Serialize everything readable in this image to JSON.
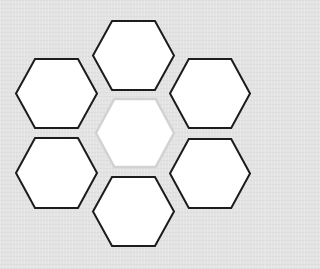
{
  "diagram": {
    "type": "hexagon-cluster",
    "background_color": "#e3e3e3",
    "hex_fill": "#ffffff",
    "outer_stroke_color": "#1c1c1c",
    "center_stroke_color": "#d2d2d2",
    "hexagons": [
      {
        "id": "top",
        "role": "outer",
        "label": "",
        "cx": 133.5,
        "cy": 55.5,
        "w": 81,
        "h": 69
      },
      {
        "id": "upper-left",
        "role": "outer",
        "label": "",
        "cx": 56.5,
        "cy": 93.5,
        "w": 81,
        "h": 69
      },
      {
        "id": "upper-right",
        "role": "outer",
        "label": "",
        "cx": 210,
        "cy": 93.5,
        "w": 80,
        "h": 69
      },
      {
        "id": "center",
        "role": "center",
        "label": "",
        "cx": 135,
        "cy": 133,
        "w": 78,
        "h": 68
      },
      {
        "id": "lower-left",
        "role": "outer",
        "label": "",
        "cx": 56.5,
        "cy": 173,
        "w": 81,
        "h": 70
      },
      {
        "id": "lower-right",
        "role": "outer",
        "label": "",
        "cx": 210,
        "cy": 173.5,
        "w": 80,
        "h": 69
      },
      {
        "id": "bottom",
        "role": "outer",
        "label": "",
        "cx": 133.5,
        "cy": 211.5,
        "w": 81,
        "h": 69
      }
    ]
  }
}
